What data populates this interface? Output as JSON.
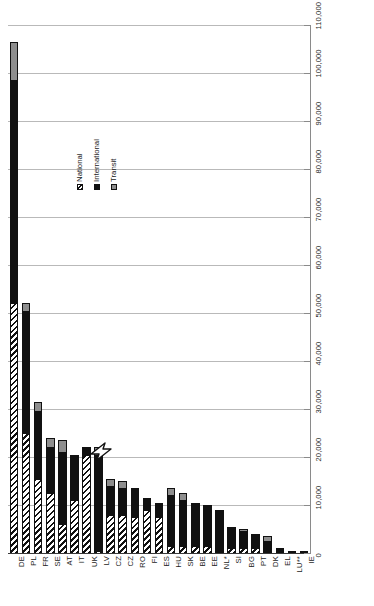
{
  "chart_data": {
    "type": "bar",
    "subtype": "stacked-bar",
    "orientation": "vertical",
    "title": "",
    "xlabel": "",
    "ylabel": "",
    "ylim": [
      0,
      110000
    ],
    "grid": true,
    "legend_position": "inside-left",
    "y_ticks": [
      "0",
      "10,000",
      "20,000",
      "30,000",
      "40,000",
      "50,000",
      "60,000",
      "70,000",
      "80,000",
      "90,000",
      "100,000",
      "110,000"
    ],
    "y_tick_values": [
      0,
      10000,
      20000,
      30000,
      40000,
      50000,
      60000,
      70000,
      80000,
      90000,
      100000,
      110000
    ],
    "categories": [
      "DE",
      "PL",
      "FR",
      "SE",
      "AT",
      "IT",
      "UK",
      "LV",
      "CZ",
      "CZ",
      "RO",
      "FI",
      "ES",
      "HU",
      "SK",
      "BE",
      "EE",
      "NL*",
      "SI",
      "BG",
      "PT",
      "DK",
      "EL",
      "LU**",
      "IE"
    ],
    "series": [
      {
        "name": "National",
        "color": "#ffffff",
        "pattern": "diagonal-hatch",
        "values": [
          52000,
          25000,
          15500,
          12500,
          6000,
          11000,
          20500,
          500,
          8000,
          8000,
          7500,
          9000,
          7500,
          1500,
          1500,
          1500,
          1500,
          0,
          1000,
          1000,
          1000,
          0,
          0,
          0,
          0
        ]
      },
      {
        "name": "International",
        "color": "#111111",
        "pattern": "solid",
        "values": [
          46500,
          25500,
          14000,
          9500,
          15000,
          9500,
          1500,
          20000,
          6000,
          5500,
          6000,
          2500,
          3000,
          10500,
          9500,
          9000,
          8500,
          9000,
          4500,
          3500,
          3000,
          2500,
          1000,
          400,
          300
        ]
      },
      {
        "name": "Transit",
        "color": "#8e8e8e",
        "pattern": "solid",
        "values": [
          8000,
          1500,
          2000,
          2000,
          2500,
          0,
          0,
          1500,
          1500,
          1500,
          0,
          0,
          0,
          1500,
          1500,
          0,
          0,
          0,
          0,
          500,
          0,
          1000,
          0,
          0,
          0
        ]
      }
    ],
    "totals": [
      106500,
      52000,
      31500,
      24000,
      23500,
      20500,
      22000,
      21500,
      15500,
      15000,
      13500,
      11500,
      10500,
      13500,
      12500,
      10500,
      10000,
      9000,
      5500,
      5000,
      4000,
      3500,
      1000,
      400,
      300
    ]
  },
  "legend": {
    "entries": [
      {
        "label": "National",
        "swatch": "hatch-swatch"
      },
      {
        "label": "International",
        "swatch": "black-swatch"
      },
      {
        "label": "Transit",
        "swatch": "gray-swatch"
      }
    ]
  },
  "cursor": {
    "icon": "mouse-pointer-icon",
    "x": 93,
    "y": 447
  }
}
